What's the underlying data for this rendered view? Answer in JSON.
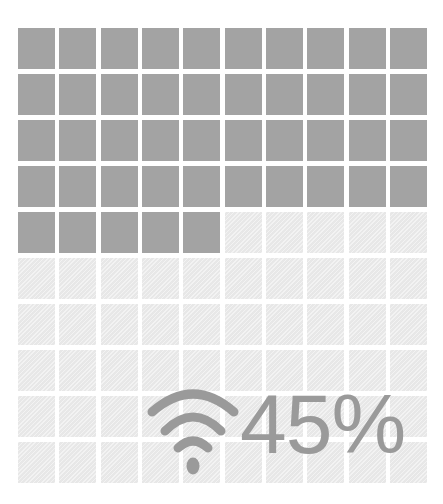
{
  "chart_data": {
    "type": "waffle",
    "title": "",
    "grid": {
      "rows": 10,
      "cols": 10,
      "total_cells": 100
    },
    "value_percent": 45,
    "filled_cells": 45,
    "empty_cells": 55,
    "label": "45%",
    "icon": "wifi-icon",
    "colors": {
      "filled": "#a3a3a3",
      "empty": "#ececec",
      "label": "#9a9a9a"
    }
  },
  "display": {
    "percent_label": "45%",
    "icon_name": "wifi-icon"
  }
}
